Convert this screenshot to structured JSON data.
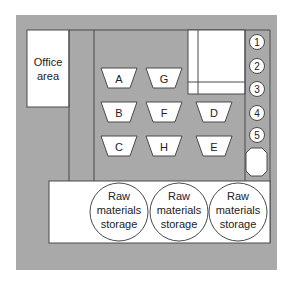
{
  "diagram": {
    "type": "facility-floor-layout",
    "colors": {
      "floor": "#a9a9a9",
      "area_fill": "#ffffff",
      "line": "#4a4a4a"
    },
    "office": {
      "label_line1": "Office",
      "label_line2": "area"
    },
    "workstations": [
      {
        "id": "A",
        "label": "A"
      },
      {
        "id": "G",
        "label": "G"
      },
      {
        "id": "B",
        "label": "B"
      },
      {
        "id": "F",
        "label": "F"
      },
      {
        "id": "D",
        "label": "D"
      },
      {
        "id": "C",
        "label": "C"
      },
      {
        "id": "H",
        "label": "H"
      },
      {
        "id": "E",
        "label": "E"
      }
    ],
    "numbered_stations": [
      "1",
      "2",
      "3",
      "4",
      "5"
    ],
    "storage": [
      {
        "line1": "Raw",
        "line2": "materials",
        "line3": "storage"
      },
      {
        "line1": "Raw",
        "line2": "materials",
        "line3": "storage"
      },
      {
        "line1": "Raw",
        "line2": "materials",
        "line3": "storage"
      }
    ]
  }
}
